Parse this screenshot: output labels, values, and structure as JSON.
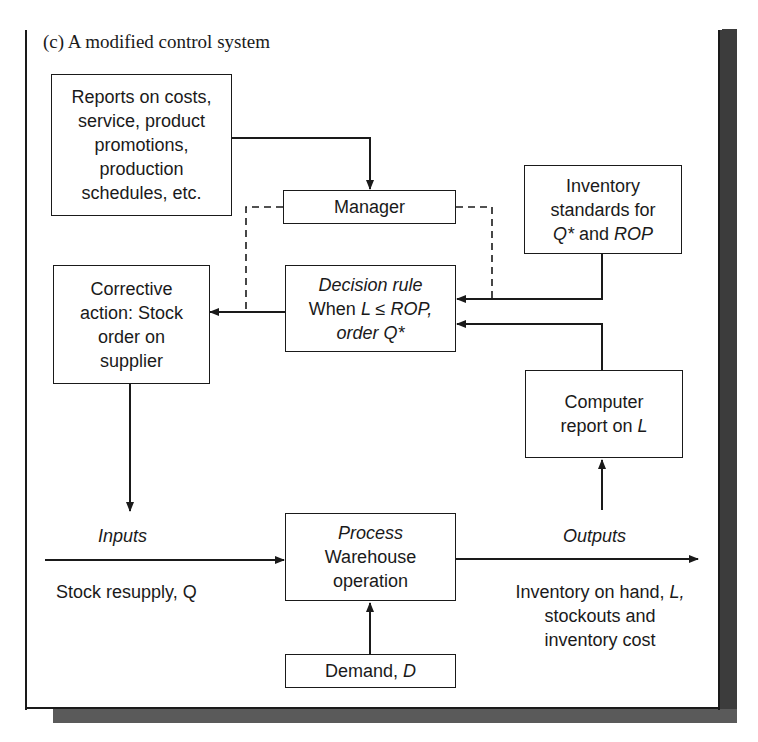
{
  "caption": "(c) A modified control system",
  "boxes": {
    "reports": {
      "lines": [
        "Reports on costs,",
        "service, product",
        "promotions,",
        "production",
        "schedules, etc."
      ]
    },
    "manager": {
      "label": "Manager"
    },
    "inventory_standards": {
      "line1": "Inventory",
      "line2": "standards for",
      "q_star": "Q*",
      "and": " and ",
      "rop": "ROP"
    },
    "corrective_action": {
      "lines": [
        "Corrective",
        "action: Stock",
        "order on",
        "supplier"
      ]
    },
    "decision_rule": {
      "title": "Decision rule",
      "when": "When ",
      "condition": "L ≤ ROP,",
      "order": "order Q*"
    },
    "computer_report": {
      "line1": "Computer",
      "line2_prefix": "report on ",
      "line2_var": "L"
    },
    "process": {
      "title": "Process",
      "line1": "Warehouse",
      "line2": "operation"
    },
    "demand": {
      "prefix": "Demand, ",
      "var": "D"
    }
  },
  "labels": {
    "inputs": "Inputs",
    "stock_resupply": "Stock resupply, Q",
    "outputs": "Outputs",
    "outputs_line1_prefix": "Inventory on hand, ",
    "outputs_line1_var": "L,",
    "outputs_line2": "stockouts and",
    "outputs_line3": "inventory cost"
  },
  "colors": {
    "ink": "#1a1a1a",
    "shadow": "#3c3c3c",
    "background": "#ffffff"
  }
}
